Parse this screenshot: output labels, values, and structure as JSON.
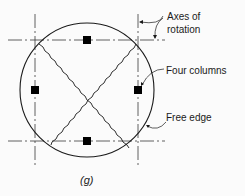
{
  "figure": {
    "caption": "(g)",
    "labels": {
      "axes_line1": "Axes of",
      "axes_line2": "rotation",
      "columns": "Four columns",
      "free_edge": "Free edge"
    },
    "colors": {
      "line": "#1a1a1a",
      "column_fill": "#000000",
      "background": "#fbfbfb"
    },
    "elements": {
      "slab_shape": "circle",
      "column_count": 4,
      "yield_lines": "two diagonal wavy lines crossing at center",
      "axes_of_rotation": "two vertical and two horizontal dash-dot lines tangent to column positions"
    }
  }
}
